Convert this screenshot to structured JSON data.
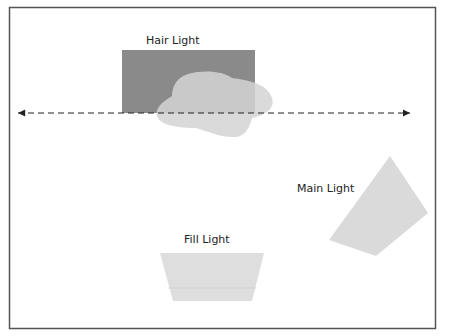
{
  "diagram": {
    "type": "lighting-setup",
    "frame": {
      "x": 9,
      "y": 7,
      "width": 426,
      "height": 321,
      "stroke": "#555555"
    },
    "axis_line": {
      "x1": 16,
      "x2": 412,
      "y": 113,
      "style": "dashed",
      "arrows": "both"
    },
    "lights": [
      {
        "id": "hair",
        "label": "Hair Light",
        "color": "#8a8a8a"
      },
      {
        "id": "main",
        "label": "Main Light",
        "color": "#dadada"
      },
      {
        "id": "fill",
        "label": "Fill Light",
        "color": "#dedede"
      }
    ],
    "subject": {
      "shape": "head-blob",
      "color": "#d6d6d6"
    }
  }
}
